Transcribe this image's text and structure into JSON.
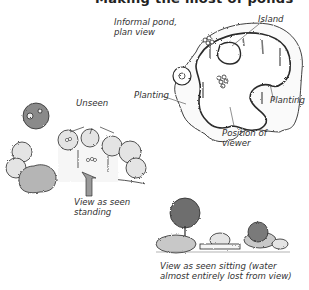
{
  "title": "Making the most of ponds",
  "labels": {
    "plan_view": [
      "Informal pond,",
      "plan view"
    ],
    "island": "Island",
    "planting_left": "Planting",
    "planting_right": "Planting",
    "position_of_viewer": [
      "Position of",
      "viewer"
    ],
    "unseen": "Unseen",
    "standing": [
      "View as seen",
      "standing"
    ],
    "sitting": [
      "View as seen sitting (water",
      "almost entirely lost from view)"
    ]
  },
  "colors": {
    "line": "#2a2a2a",
    "shrub_light": "#e4e4e4",
    "shrub_mid": "#c8c8c8",
    "shrub_dark": "#8a8a8a",
    "tree_dark": "#6e6e6e",
    "arrow": "#9a9a9a"
  }
}
